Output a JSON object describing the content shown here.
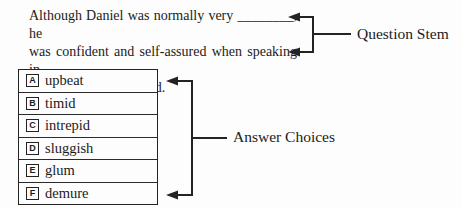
{
  "stem": {
    "line1": "Although Daniel was normally very ________, he",
    "line2": "was confident and self-assured when speaking in",
    "line3": "front of the large crowd.",
    "label": "Question Stem"
  },
  "choices": {
    "label": "Answer Choices",
    "items": [
      {
        "letter": "A",
        "text": "upbeat"
      },
      {
        "letter": "B",
        "text": "timid"
      },
      {
        "letter": "C",
        "text": "intrepid"
      },
      {
        "letter": "D",
        "text": "sluggish"
      },
      {
        "letter": "E",
        "text": "glum"
      },
      {
        "letter": "F",
        "text": "demure"
      }
    ]
  },
  "colors": {
    "ink": "#1b1b1b",
    "line": "#232323",
    "background": "#fdfdfd"
  }
}
